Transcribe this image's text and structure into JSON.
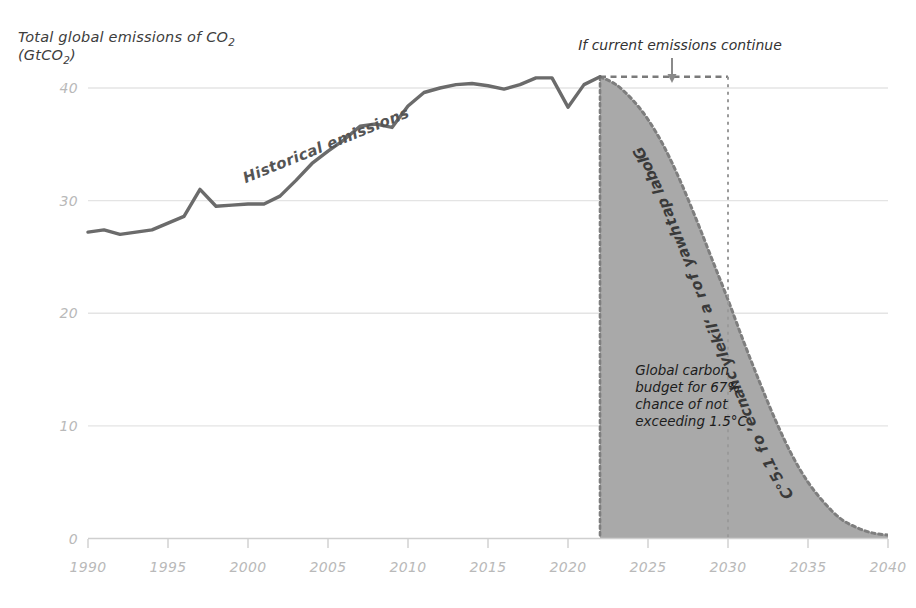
{
  "chart_data": {
    "type": "area",
    "title": "Total global emissions of CO2 (GtCO2)",
    "title_line1": "Total global emissions of CO",
    "title_sub1": "2",
    "title_line2": "(GtCO",
    "title_sub2": "2",
    "title_line2_end": ")",
    "xlabel": "",
    "ylabel": "GtCO2",
    "xlim": [
      1990,
      2040
    ],
    "ylim": [
      0,
      42
    ],
    "grid": "horizontal",
    "legend": "none",
    "x_ticks": [
      "1990",
      "1995",
      "2000",
      "2005",
      "2010",
      "2015",
      "2020",
      "2025",
      "2030",
      "2035",
      "2040"
    ],
    "x_tick_values": [
      1990,
      1995,
      2000,
      2005,
      2010,
      2015,
      2020,
      2025,
      2030,
      2035,
      2040
    ],
    "y_ticks": [
      "0",
      "10",
      "20",
      "30",
      "40"
    ],
    "y_tick_values": [
      0,
      10,
      20,
      30,
      40
    ],
    "series": [
      {
        "name": "Historical emissions",
        "style": "solid-line",
        "color": "#6b6b6b",
        "x": [
          1990,
          1991,
          1992,
          1993,
          1994,
          1995,
          1996,
          1997,
          1998,
          1999,
          2000,
          2001,
          2002,
          2003,
          2004,
          2005,
          2006,
          2007,
          2008,
          2009,
          2010,
          2011,
          2012,
          2013,
          2014,
          2015,
          2016,
          2017,
          2018,
          2019,
          2020,
          2021,
          2022
        ],
        "values": [
          27.2,
          27.4,
          27.0,
          27.2,
          27.4,
          28.0,
          28.6,
          31.0,
          29.5,
          29.6,
          29.7,
          29.7,
          30.4,
          31.8,
          33.3,
          34.4,
          35.4,
          36.6,
          36.8,
          36.5,
          38.4,
          39.6,
          40.0,
          40.3,
          40.4,
          40.2,
          39.9,
          40.3,
          40.9,
          40.9,
          38.3,
          40.3,
          41.0
        ]
      },
      {
        "name": "Global pathway for a 'likely' chance' of 1.5°C",
        "style": "dashed-line-with-fill",
        "color": "#8c8c8c",
        "fill": "#a9a9a9",
        "x": [
          2022,
          2023,
          2024,
          2025,
          2026,
          2027,
          2028,
          2029,
          2030,
          2031,
          2032,
          2033,
          2034,
          2035,
          2036,
          2037,
          2038,
          2039,
          2040
        ],
        "values": [
          41.0,
          40.3,
          39.0,
          37.2,
          34.8,
          31.8,
          28.4,
          24.8,
          21.2,
          17.4,
          13.8,
          10.4,
          7.4,
          5.0,
          3.2,
          1.8,
          1.0,
          0.5,
          0.3
        ]
      },
      {
        "name": "If current emissions continue",
        "style": "dashed-horizontal",
        "color": "#7a7a7a",
        "x": [
          2022,
          2030
        ],
        "values": [
          41.0,
          41.0
        ]
      }
    ],
    "annotations": [
      {
        "id": "historical-emissions",
        "text": "Historical emissions",
        "rotation": -22,
        "x": 2005,
        "y": 34.5
      },
      {
        "id": "if-current-emissions",
        "text": "If current emissions continue",
        "rotation": 0,
        "x": 2027,
        "y": 42.5
      },
      {
        "id": "global-pathway",
        "text": "Global pathway for a 'likely' chance' of 1.5°C",
        "rotation": 72,
        "x": 2027,
        "y": 24
      },
      {
        "id": "carbon-budget-line-1",
        "text": "Global carbon",
        "x": 2024.2,
        "y": 14.5
      },
      {
        "id": "carbon-budget-line-2",
        "text": "budget for 67%",
        "x": 2024.2,
        "y": 13.0
      },
      {
        "id": "carbon-budget-line-3",
        "text": "chance of not",
        "x": 2024.2,
        "y": 11.5
      },
      {
        "id": "carbon-budget-line-4",
        "text": "exceeding 1.5°C",
        "x": 2024.2,
        "y": 10.0
      }
    ],
    "markers": [
      {
        "id": "down-arrow",
        "type": "arrow",
        "direction": "down",
        "x": 2026.5,
        "y_from": 42.0,
        "y_to": 41.2
      },
      {
        "id": "vertical-dashed-2030",
        "type": "vline",
        "x": 2030,
        "y_from": 41.0,
        "y_to": 0
      }
    ],
    "colors": {
      "historical_line": "#6b6b6b",
      "pathway_dash": "#8c8c8c",
      "budget_fill": "#a9a9a9",
      "gridline": "#e4e4e4",
      "axis": "#c9c9c9",
      "tick_text": "#b9b9b9",
      "annotation_text": "#333333"
    }
  },
  "pathway_label_chars": [
    "G",
    "l",
    "o",
    "b",
    "a",
    "l",
    " ",
    "p",
    "a",
    "t",
    "h",
    "w",
    "a",
    "y",
    " ",
    "f",
    "o",
    "r",
    " ",
    "a",
    " ",
    "‘",
    "l",
    "i",
    "k",
    "e",
    "l",
    "y",
    " ",
    "c",
    "h",
    "a",
    "n",
    "c",
    "e",
    "’",
    " ",
    "o",
    "f",
    " ",
    "1",
    ".",
    "5",
    "°",
    "C"
  ]
}
